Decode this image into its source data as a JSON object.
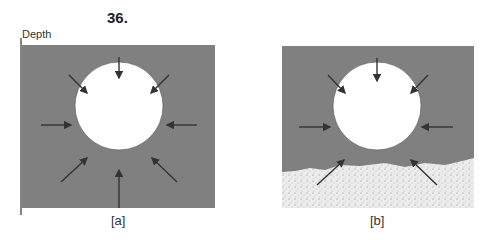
{
  "figure": {
    "number": "36.",
    "axis_label": "Depth",
    "panels": [
      {
        "caption": "[a]",
        "description": "Bubble surrounded by uniform medium; arrows point inward from all directions"
      },
      {
        "caption": "[b]",
        "description": "Bubble resting on sediment; lower arrows partially in sediment"
      }
    ],
    "colors": {
      "medium": "#808080",
      "bubble": "#ffffff",
      "sediment": "#e8e8e8",
      "arrow": "#333333"
    }
  }
}
